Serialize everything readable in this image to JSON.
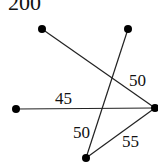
{
  "title": "200",
  "nodes": [
    {
      "id": "A",
      "x": 42,
      "y": 29
    },
    {
      "id": "B",
      "x": 128,
      "y": 29
    },
    {
      "id": "C",
      "x": 16,
      "y": 109
    },
    {
      "id": "D",
      "x": 155,
      "y": 108
    },
    {
      "id": "E",
      "x": 86,
      "y": 158
    }
  ],
  "edges": [
    {
      "from": "A",
      "to": "D",
      "weight": "50",
      "label_x": 129,
      "label_y": 86
    },
    {
      "from": "C",
      "to": "D",
      "weight": "45",
      "label_x": 55,
      "label_y": 104
    },
    {
      "from": "B",
      "to": "E",
      "weight": "50",
      "label_x": 73,
      "label_y": 138
    },
    {
      "from": "E",
      "to": "D",
      "weight": "55",
      "label_x": 122,
      "label_y": 147
    }
  ]
}
